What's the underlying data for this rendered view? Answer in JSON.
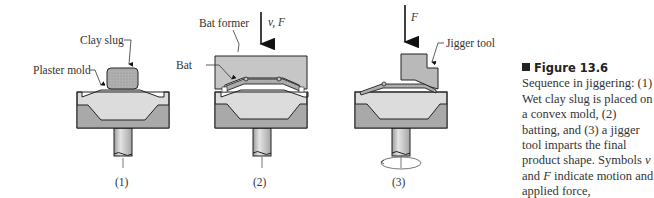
{
  "figure": {
    "stages": [
      {
        "number": "(1)",
        "labels": {
          "slug": "Clay slug",
          "mold": "Plaster mold"
        }
      },
      {
        "number": "(2)",
        "labels": {
          "former": "Bat former",
          "bat": "Bat",
          "motion": "v, F"
        }
      },
      {
        "number": "(3)",
        "labels": {
          "tool": "Jigger tool",
          "force": "F"
        }
      }
    ],
    "colors": {
      "mold_light": "#dcdcdc",
      "mold_dark": "#a9a9a9",
      "clay": "#b5b5b5",
      "tool": "#b9b9b9",
      "shaft": "#c8c8c8",
      "outline": "#222222"
    }
  },
  "caption": {
    "title": "Figure 13.6",
    "text_1": "Sequence in jiggering: (1) Wet clay slug is placed on a convex mold, (2) batting, and (3) a jigger tool imparts the final product shape. Symbols ",
    "sym_v": "v",
    "text_2": " and ",
    "sym_F": "F",
    "text_3": " indicate motion and applied force, respectively."
  }
}
